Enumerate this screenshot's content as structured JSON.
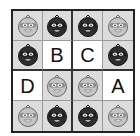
{
  "puzzle": {
    "rows": 4,
    "cols": 4,
    "cells": [
      [
        {
          "type": "light-ninja"
        },
        {
          "type": "dark-ninja"
        },
        {
          "type": "dark-ninja"
        },
        {
          "type": "light-ninja"
        }
      ],
      [
        {
          "type": "dark-ninja"
        },
        {
          "type": "letter",
          "value": "B"
        },
        {
          "type": "letter",
          "value": "C"
        },
        {
          "type": "dark-ninja"
        }
      ],
      [
        {
          "type": "letter",
          "value": "D"
        },
        {
          "type": "light-ninja"
        },
        {
          "type": "light-ninja"
        },
        {
          "type": "letter",
          "value": "A"
        }
      ],
      [
        {
          "type": "light-ninja"
        },
        {
          "type": "dark-ninja"
        },
        {
          "type": "dark-ninja"
        },
        {
          "type": "light-ninja"
        }
      ]
    ]
  },
  "colors": {
    "ninja_cell_bg": "#dcdcdc",
    "letter_cell_bg": "#ffffff",
    "dark_ninja": "#2e2e2e",
    "light_ninja": "#bdbdbd",
    "border": "#222222"
  }
}
